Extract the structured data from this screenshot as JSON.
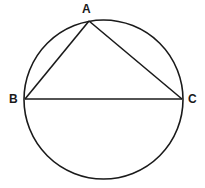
{
  "diagram": {
    "type": "circle-inscribed-triangle",
    "stroke_color": "#1a1a1a",
    "background": "#ffffff",
    "circle": {
      "cx": 103.5,
      "cy": 99.5,
      "r": 79.5
    },
    "points": {
      "A": {
        "label": "A",
        "x": 89,
        "y": 21
      },
      "B": {
        "label": "B",
        "x": 25,
        "y": 99
      },
      "C": {
        "label": "C",
        "x": 182,
        "y": 99
      }
    },
    "segments": [
      {
        "from": "A",
        "to": "B"
      },
      {
        "from": "A",
        "to": "C"
      },
      {
        "from": "B",
        "to": "C"
      }
    ]
  }
}
